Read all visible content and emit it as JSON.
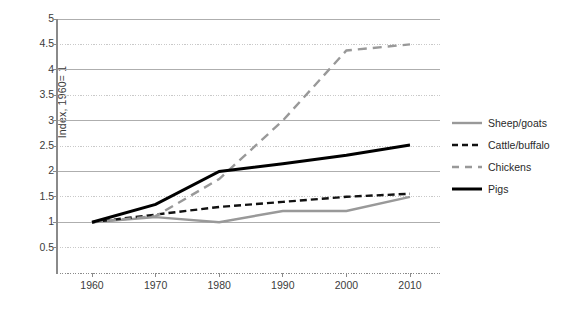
{
  "chart_data": {
    "type": "line",
    "title": "",
    "xlabel": "",
    "ylabel": "Index, 1960= 1",
    "x": [
      1960,
      1970,
      1980,
      1990,
      2000,
      2010
    ],
    "xticklabels": [
      "1960",
      "1970",
      "1980",
      "1990",
      "2000",
      "2010"
    ],
    "xlim": [
      1955,
      2015
    ],
    "ylim": [
      0,
      5
    ],
    "yticks": [
      0.5,
      1,
      1.5,
      2,
      2.5,
      3,
      3.5,
      4,
      4.5,
      5
    ],
    "yticklabels": [
      "0.5",
      "1",
      "1.5",
      "2",
      "2.5",
      "3",
      "3.5",
      "4",
      "4.5",
      "5"
    ],
    "grid": true,
    "legend_position": "right",
    "series": [
      {
        "name": "Sheep/goats",
        "values": [
          1.0,
          1.1,
          1.0,
          1.22,
          1.22,
          1.5
        ],
        "color": "#999999",
        "style": "solid",
        "width": 2.4
      },
      {
        "name": "Cattle/buffalo",
        "values": [
          1.0,
          1.15,
          1.3,
          1.4,
          1.5,
          1.56
        ],
        "color": "#111111",
        "style": "dashed",
        "width": 2.4
      },
      {
        "name": "Chickens",
        "values": [
          1.0,
          1.12,
          1.85,
          3.0,
          4.38,
          4.5
        ],
        "color": "#999999",
        "style": "dashed",
        "width": 2.4
      },
      {
        "name": "Pigs",
        "values": [
          1.0,
          1.35,
          2.0,
          2.15,
          2.32,
          2.52
        ],
        "color": "#000000",
        "style": "solid",
        "width": 3.0
      }
    ]
  },
  "legend": {
    "items": [
      {
        "label": "Sheep/goats"
      },
      {
        "label": "Cattle/buffalo"
      },
      {
        "label": "Chickens"
      },
      {
        "label": "Pigs"
      }
    ]
  },
  "axes": {
    "y_axis_title": "Index, 1960= 1"
  }
}
